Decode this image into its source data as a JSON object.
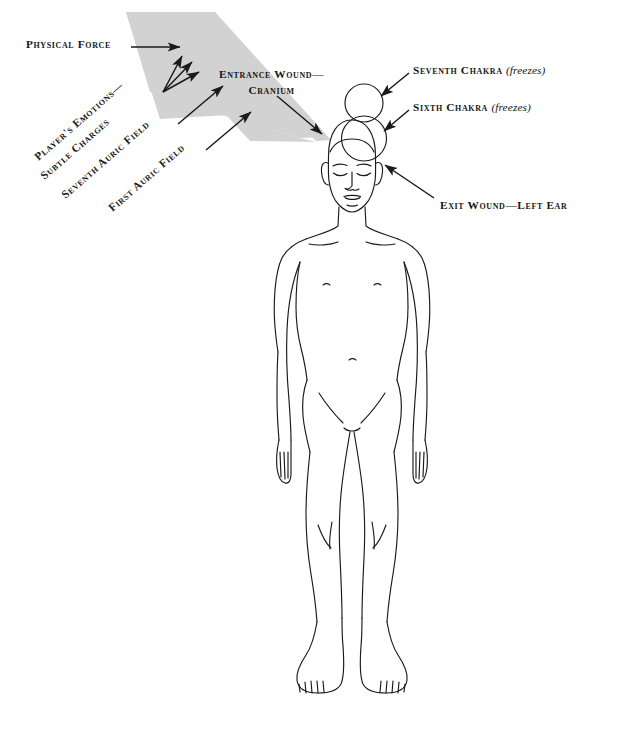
{
  "figure": {
    "background_color": "#ffffff",
    "line_color": "#1a1a1a",
    "force_band_color": "#d2d2d2"
  },
  "labels": {
    "physical_force": "Physical Force",
    "entrance_wound": "Entrance Wound—\nCranium",
    "seventh_chakra": "Seventh Chakra ",
    "seventh_chakra_note": "(freezes)",
    "sixth_chakra": "Sixth Chakra ",
    "sixth_chakra_note": "(freezes)",
    "exit_wound": "Exit Wound—Left Ear",
    "players_emotions": "Player's Emotions—",
    "subtle_charges": "Subtle Charges",
    "seventh_auric_field": "Seventh Auric Field",
    "first_auric_field": "First Auric Field"
  },
  "diagram_elements": {
    "seventh_chakra_circle": "circle above crown of head",
    "sixth_chakra_circle": "circle overlapping crown of head",
    "force_band": "tapered gray arrow band entering cranium from upper left",
    "emotion_arrows": "three fanned arrows rising toward force band",
    "body": "frontal outline of standing nude human figure, eyes closed"
  }
}
